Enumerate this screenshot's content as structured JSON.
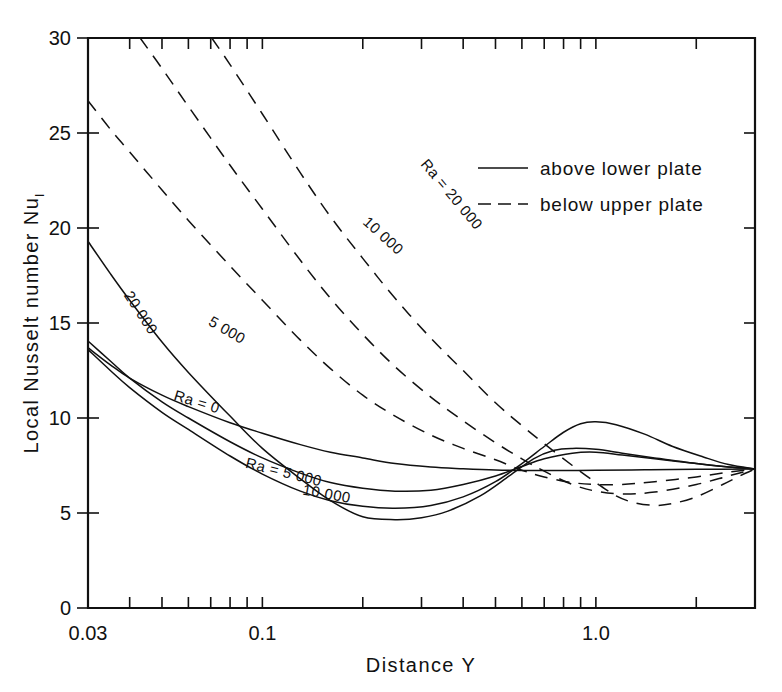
{
  "chart_data": {
    "type": "line",
    "title": "",
    "xlabel": "Distance  Y",
    "ylabel": "Local  Nusselt  number  Nu",
    "ylabel_subscript": "l",
    "xscale": "log",
    "yscale": "linear",
    "xlim": [
      0.03,
      3.0
    ],
    "ylim": [
      0,
      30
    ],
    "xticks_labeled": [
      {
        "value": 0.03,
        "label": "0.03"
      },
      {
        "value": 0.1,
        "label": "0.1"
      },
      {
        "value": 1.0,
        "label": "1.0"
      }
    ],
    "xticks_minor": [
      0.04,
      0.05,
      0.06,
      0.07,
      0.08,
      0.09,
      0.2,
      0.3,
      0.4,
      0.5,
      0.6,
      0.7,
      0.8,
      0.9,
      2.0,
      3.0
    ],
    "yticks": [
      {
        "value": 0,
        "label": "0"
      },
      {
        "value": 5,
        "label": "5"
      },
      {
        "value": 10,
        "label": "10"
      },
      {
        "value": 15,
        "label": "15"
      },
      {
        "value": 20,
        "label": "20"
      },
      {
        "value": 25,
        "label": "25"
      },
      {
        "value": 30,
        "label": "30"
      }
    ],
    "grid": false,
    "legend_position": "top-right",
    "legend": [
      {
        "label": "above lower plate",
        "style": "solid"
      },
      {
        "label": "below upper plate",
        "style": "dashed"
      }
    ],
    "series": [
      {
        "name": "Ra = 0",
        "style": "solid",
        "group": "above lower plate",
        "label": "Ra = 0",
        "label_x": 0.063,
        "label_y": 10.6,
        "label_rotation": 17,
        "points": [
          [
            0.03,
            13.7
          ],
          [
            0.035,
            12.8
          ],
          [
            0.04,
            12.1
          ],
          [
            0.05,
            11.2
          ],
          [
            0.06,
            10.6
          ],
          [
            0.08,
            9.75
          ],
          [
            0.1,
            9.2
          ],
          [
            0.13,
            8.6
          ],
          [
            0.16,
            8.2
          ],
          [
            0.2,
            7.9
          ],
          [
            0.25,
            7.6
          ],
          [
            0.32,
            7.42
          ],
          [
            0.4,
            7.33
          ],
          [
            0.5,
            7.26
          ],
          [
            0.6,
            7.24
          ],
          [
            0.8,
            7.24
          ],
          [
            1.0,
            7.25
          ],
          [
            1.4,
            7.27
          ],
          [
            2.0,
            7.3
          ],
          [
            3.0,
            7.32
          ]
        ]
      },
      {
        "name": "Ra = 5 000",
        "style": "solid",
        "group": "above lower plate",
        "label": "Ra = 5 000",
        "label_x": 0.115,
        "label_y": 6.9,
        "label_rotation": 14,
        "points": [
          [
            0.03,
            14.05
          ],
          [
            0.035,
            13.0
          ],
          [
            0.04,
            12.1
          ],
          [
            0.05,
            10.85
          ],
          [
            0.06,
            10.0
          ],
          [
            0.08,
            8.75
          ],
          [
            0.1,
            7.9
          ],
          [
            0.13,
            7.1
          ],
          [
            0.16,
            6.6
          ],
          [
            0.2,
            6.3
          ],
          [
            0.25,
            6.15
          ],
          [
            0.32,
            6.2
          ],
          [
            0.4,
            6.5
          ],
          [
            0.5,
            6.95
          ],
          [
            0.6,
            7.45
          ],
          [
            0.7,
            7.85
          ],
          [
            0.85,
            8.15
          ],
          [
            1.0,
            8.2
          ],
          [
            1.2,
            8.05
          ],
          [
            1.5,
            7.85
          ],
          [
            2.0,
            7.6
          ],
          [
            2.5,
            7.42
          ],
          [
            3.0,
            7.32
          ]
        ]
      },
      {
        "name": "Ra = 10 000",
        "style": "solid",
        "group": "above lower plate",
        "label": "10 000",
        "label_x": 0.155,
        "label_y": 5.75,
        "label_rotation": 10,
        "points": [
          [
            0.03,
            13.6
          ],
          [
            0.035,
            12.5
          ],
          [
            0.04,
            11.6
          ],
          [
            0.05,
            10.3
          ],
          [
            0.06,
            9.4
          ],
          [
            0.08,
            8.0
          ],
          [
            0.1,
            7.05
          ],
          [
            0.13,
            6.15
          ],
          [
            0.16,
            5.65
          ],
          [
            0.2,
            5.35
          ],
          [
            0.25,
            5.25
          ],
          [
            0.32,
            5.4
          ],
          [
            0.4,
            5.85
          ],
          [
            0.5,
            6.65
          ],
          [
            0.6,
            7.6
          ],
          [
            0.7,
            8.5
          ],
          [
            0.8,
            9.25
          ],
          [
            0.9,
            9.7
          ],
          [
            1.0,
            9.8
          ],
          [
            1.15,
            9.65
          ],
          [
            1.4,
            9.15
          ],
          [
            1.7,
            8.5
          ],
          [
            2.1,
            7.95
          ],
          [
            2.5,
            7.55
          ],
          [
            3.0,
            7.32
          ]
        ]
      },
      {
        "name": "Ra = 20 000",
        "style": "solid",
        "group": "above lower plate",
        "label": "20 000",
        "label_x": 0.042,
        "label_y": 15.4,
        "label_rotation": 57,
        "points": [
          [
            0.03,
            19.3
          ],
          [
            0.035,
            17.6
          ],
          [
            0.04,
            16.2
          ],
          [
            0.05,
            14.0
          ],
          [
            0.06,
            12.4
          ],
          [
            0.08,
            10.1
          ],
          [
            0.1,
            8.4
          ],
          [
            0.13,
            6.8
          ],
          [
            0.16,
            5.65
          ],
          [
            0.2,
            4.8
          ],
          [
            0.25,
            4.65
          ],
          [
            0.3,
            4.75
          ],
          [
            0.36,
            5.1
          ],
          [
            0.45,
            5.9
          ],
          [
            0.55,
            6.95
          ],
          [
            0.65,
            7.85
          ],
          [
            0.75,
            8.3
          ],
          [
            0.85,
            8.4
          ],
          [
            1.0,
            8.35
          ],
          [
            1.2,
            8.15
          ],
          [
            1.5,
            7.9
          ],
          [
            2.0,
            7.6
          ],
          [
            2.5,
            7.42
          ],
          [
            3.0,
            7.32
          ]
        ]
      },
      {
        "name": "Ra = 5 000 upper",
        "style": "dashed",
        "group": "below upper plate",
        "label": "5 000",
        "label_x": 0.077,
        "label_y": 14.4,
        "label_rotation": 30,
        "points": [
          [
            0.03,
            26.7
          ],
          [
            0.035,
            25.2
          ],
          [
            0.04,
            24.0
          ],
          [
            0.05,
            22.0
          ],
          [
            0.06,
            20.4
          ],
          [
            0.08,
            18.0
          ],
          [
            0.1,
            16.2
          ],
          [
            0.13,
            14.1
          ],
          [
            0.16,
            12.6
          ],
          [
            0.2,
            11.2
          ],
          [
            0.25,
            10.1
          ],
          [
            0.32,
            9.1
          ],
          [
            0.4,
            8.4
          ],
          [
            0.5,
            7.8
          ],
          [
            0.6,
            7.25
          ],
          [
            0.7,
            6.9
          ],
          [
            0.85,
            6.6
          ],
          [
            1.0,
            6.5
          ],
          [
            1.2,
            6.5
          ],
          [
            1.5,
            6.65
          ],
          [
            2.0,
            6.9
          ],
          [
            2.5,
            7.15
          ],
          [
            3.0,
            7.32
          ]
        ]
      },
      {
        "name": "Ra = 10 000 upper",
        "style": "dashed",
        "group": "below upper plate",
        "label": "10 000",
        "label_x": 0.225,
        "label_y": 19.4,
        "label_rotation": 42,
        "points": [
          [
            0.043,
            30.0
          ],
          [
            0.05,
            28.4
          ],
          [
            0.06,
            26.4
          ],
          [
            0.08,
            23.3
          ],
          [
            0.1,
            21.0
          ],
          [
            0.13,
            18.3
          ],
          [
            0.16,
            16.3
          ],
          [
            0.2,
            14.4
          ],
          [
            0.25,
            12.7
          ],
          [
            0.32,
            11.1
          ],
          [
            0.4,
            9.85
          ],
          [
            0.5,
            8.7
          ],
          [
            0.6,
            7.85
          ],
          [
            0.7,
            7.2
          ],
          [
            0.85,
            6.5
          ],
          [
            1.0,
            6.15
          ],
          [
            1.2,
            6.0
          ],
          [
            1.5,
            6.1
          ],
          [
            2.0,
            6.5
          ],
          [
            2.5,
            6.95
          ],
          [
            3.0,
            7.32
          ]
        ]
      },
      {
        "name": "Ra = 20 000 upper",
        "style": "dashed",
        "group": "below upper plate",
        "label": "Ra = 20 000",
        "label_x": 0.36,
        "label_y": 21.6,
        "label_rotation": 50,
        "points": [
          [
            0.0705,
            30.0
          ],
          [
            0.08,
            28.6
          ],
          [
            0.1,
            26.0
          ],
          [
            0.13,
            22.9
          ],
          [
            0.16,
            20.6
          ],
          [
            0.2,
            18.4
          ],
          [
            0.25,
            16.3
          ],
          [
            0.32,
            14.2
          ],
          [
            0.4,
            12.5
          ],
          [
            0.5,
            10.8
          ],
          [
            0.6,
            9.6
          ],
          [
            0.7,
            8.65
          ],
          [
            0.85,
            7.5
          ],
          [
            1.0,
            6.6
          ],
          [
            1.15,
            5.9
          ],
          [
            1.3,
            5.55
          ],
          [
            1.5,
            5.4
          ],
          [
            1.7,
            5.5
          ],
          [
            2.0,
            5.85
          ],
          [
            2.4,
            6.5
          ],
          [
            2.7,
            6.95
          ],
          [
            3.0,
            7.32
          ]
        ]
      }
    ]
  }
}
